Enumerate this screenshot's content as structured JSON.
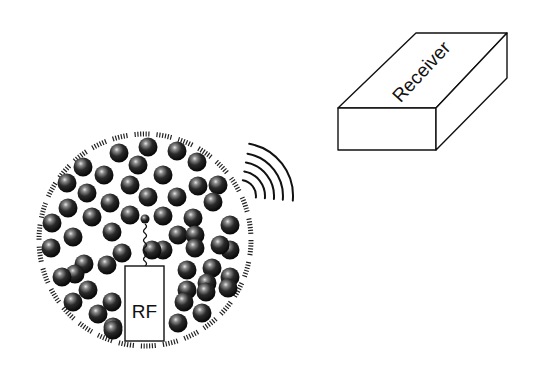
{
  "diagram": {
    "receiver": {
      "label": "Receiver",
      "top_face": "338,108 416,33 507,33 436,108",
      "front_face": "338,108 436,108 436,150 338,150",
      "side_face": "436,108 507,33 507,78 436,150",
      "label_x": 426,
      "label_y": 76,
      "label_rotate": -47
    },
    "transmitter": {
      "label": "RF",
      "box": {
        "x": 125,
        "y": 266,
        "w": 39,
        "h": 75
      },
      "label_x": 144.5,
      "label_y": 318
    },
    "container": {
      "cx": 145,
      "cy": 240,
      "r": 106
    },
    "antenna": {
      "ball": {
        "cx": 145,
        "cy": 219,
        "r": 4.5
      },
      "spring_top": 224,
      "spring_bottom": 266
    },
    "signal_waves": [
      {
        "r": 10
      },
      {
        "r": 19
      },
      {
        "r": 28
      },
      {
        "r": 37
      },
      {
        "r": 47
      }
    ],
    "balls": [
      [
        148,
        147
      ],
      [
        119,
        153
      ],
      [
        177,
        151
      ],
      [
        83,
        167
      ],
      [
        138,
        165
      ],
      [
        197,
        162
      ],
      [
        104,
        175
      ],
      [
        163,
        175
      ],
      [
        67,
        183
      ],
      [
        130,
        185
      ],
      [
        198,
        186
      ],
      [
        218,
        185
      ],
      [
        87,
        193
      ],
      [
        148,
        197
      ],
      [
        177,
        197
      ],
      [
        110,
        203
      ],
      [
        213,
        202
      ],
      [
        68,
        208
      ],
      [
        92,
        217
      ],
      [
        130,
        215
      ],
      [
        163,
        216
      ],
      [
        193,
        218
      ],
      [
        230,
        225
      ],
      [
        52,
        223
      ],
      [
        112,
        232
      ],
      [
        73,
        237
      ],
      [
        178,
        235
      ],
      [
        195,
        235
      ],
      [
        230,
        250
      ],
      [
        51,
        248
      ],
      [
        163,
        250
      ],
      [
        195,
        248
      ],
      [
        220,
        245
      ],
      [
        84,
        264
      ],
      [
        122,
        253
      ],
      [
        75,
        274
      ],
      [
        152,
        250
      ],
      [
        187,
        270
      ],
      [
        212,
        268
      ],
      [
        230,
        277
      ],
      [
        62,
        277
      ],
      [
        107,
        265
      ],
      [
        207,
        283
      ],
      [
        228,
        288
      ],
      [
        88,
        290
      ],
      [
        187,
        290
      ],
      [
        206,
        292
      ],
      [
        73,
        302
      ],
      [
        112,
        302
      ],
      [
        184,
        302
      ],
      [
        202,
        313
      ],
      [
        98,
        314
      ],
      [
        113,
        327
      ],
      [
        178,
        323
      ],
      [
        113,
        330
      ]
    ],
    "colors": {
      "ink": "#111111",
      "ball_dark": "#0a0a0a",
      "ball_mid": "#3a3a3a",
      "ball_hi": "#d8d8d8"
    }
  }
}
